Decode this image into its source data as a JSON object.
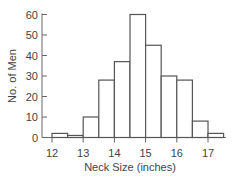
{
  "chart_data": {
    "type": "bar",
    "subtype": "histogram",
    "title": "",
    "xlabel": "Neck Size (inches)",
    "ylabel": "No. of Men",
    "bin_width": 0.5,
    "bin_edges": [
      12.0,
      12.5,
      13.0,
      13.5,
      14.0,
      14.5,
      15.0,
      15.5,
      16.0,
      16.5,
      17.0,
      17.5
    ],
    "categories": [
      "12.0-12.5",
      "12.5-13.0",
      "13.0-13.5",
      "13.5-14.0",
      "14.0-14.5",
      "14.5-15.0",
      "15.0-15.5",
      "15.5-16.0",
      "16.0-16.5",
      "16.5-17.0",
      "17.0-17.5"
    ],
    "values": [
      2,
      1,
      10,
      28,
      37,
      60,
      45,
      30,
      28,
      8,
      2
    ],
    "xlim": [
      12,
      17.5
    ],
    "ylim": [
      0,
      60
    ],
    "x_ticks": [
      12,
      13,
      14,
      15,
      16,
      17
    ],
    "y_ticks": [
      0,
      10,
      20,
      30,
      40,
      50,
      60
    ],
    "grid": false,
    "legend": null,
    "bar_fill": "#ffffff",
    "bar_stroke": "#555555"
  }
}
